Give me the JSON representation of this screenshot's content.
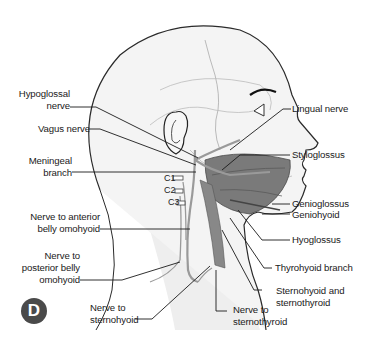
{
  "figure": {
    "panel_letter": "D",
    "labels_left": [
      {
        "id": "hypoglossal",
        "text_lines": [
          "Hypoglossal",
          "nerve"
        ]
      },
      {
        "id": "vagus",
        "text_lines": [
          "Vagus nerve"
        ]
      },
      {
        "id": "meningeal",
        "text_lines": [
          "Meningeal",
          "branch"
        ]
      },
      {
        "id": "ant_omohyoid",
        "text_lines": [
          "Nerve to anterior",
          "belly omohyoid"
        ]
      },
      {
        "id": "post_omohyoid",
        "text_lines": [
          "Nerve to",
          "posterior belly",
          "omohyoid"
        ]
      }
    ],
    "labels_right": [
      {
        "id": "lingual",
        "text_lines": [
          "Lingual nerve"
        ]
      },
      {
        "id": "styloglossus",
        "text_lines": [
          "Styloglossus"
        ]
      },
      {
        "id": "genioglossus",
        "text_lines": [
          "Genioglossus"
        ]
      },
      {
        "id": "geniohyoid",
        "text_lines": [
          "Geniohyoid"
        ]
      },
      {
        "id": "hyoglossus",
        "text_lines": [
          "Hyoglossus"
        ]
      },
      {
        "id": "thyrohyoid",
        "text_lines": [
          "Thyrohyoid branch"
        ]
      },
      {
        "id": "sternohyoid_sternothyroid",
        "text_lines": [
          "Sternohyoid and",
          "sternothyroid"
        ]
      }
    ],
    "labels_bottom": [
      {
        "id": "sternohyoid",
        "text_lines": [
          "Nerve to",
          "sternohyoid"
        ]
      },
      {
        "id": "sternothyroid",
        "text_lines": [
          "Nerve to",
          "sternothyroid"
        ]
      }
    ],
    "cervical_roots": [
      "C1",
      "C2",
      "C3"
    ],
    "colors": {
      "outline": "#2a2a2a",
      "skin_fill": "#f4f4f4",
      "muscle": "#6e6e6e",
      "nerve": "#9a9a9a",
      "leader": "#1a1a1a",
      "badge": "#4a4a4a"
    }
  }
}
